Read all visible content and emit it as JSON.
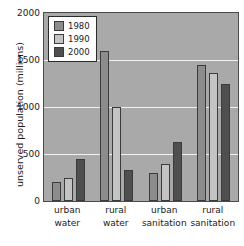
{
  "chart_data": {
    "type": "bar",
    "title": "",
    "xlabel": "",
    "ylabel": "unserved population (millions)",
    "categories": [
      "urban water",
      "rural water",
      "urban sanitation",
      "rural sanitation"
    ],
    "category_lines": [
      [
        "urban",
        "water"
      ],
      [
        "rural",
        "water"
      ],
      [
        "urban",
        "sanitation"
      ],
      [
        "rural",
        "sanitation"
      ]
    ],
    "series": [
      {
        "name": "1980",
        "color": "#8c8c8c",
        "values": [
          205,
          1600,
          300,
          1450
        ]
      },
      {
        "name": "1990",
        "color": "#c4c4c4",
        "values": [
          245,
          1000,
          390,
          1360
        ]
      },
      {
        "name": "2000",
        "color": "#4f4f4f",
        "values": [
          445,
          330,
          630,
          1240
        ]
      }
    ],
    "ylim": [
      0,
      2000
    ],
    "yticks": [
      0,
      500,
      1000,
      1500,
      2000
    ],
    "ytick_labels": [
      "0",
      "500",
      "1000",
      "1500",
      "2000"
    ],
    "grid": true,
    "gridline_color": "#f2f2f2",
    "plot_background": "#a9a9a9",
    "legend_position": "upper-left-inside",
    "legend_entries": [
      "1980",
      "1990",
      "2000"
    ]
  }
}
